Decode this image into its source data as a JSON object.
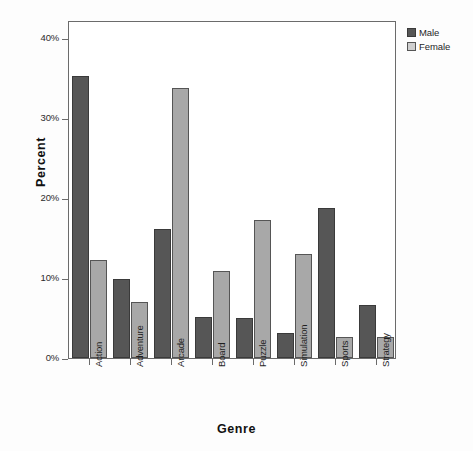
{
  "chart_data": {
    "type": "bar",
    "title": "",
    "xlabel": "Genre",
    "ylabel": "Percent",
    "categories": [
      "Action",
      "Adventure",
      "Arcade",
      "Board",
      "Puzzle",
      "Simulation",
      "Sports",
      "Strategy"
    ],
    "series": [
      {
        "name": "Male",
        "color": "#565656",
        "values": [
          35.3,
          9.9,
          16.1,
          5.1,
          5.0,
          3.1,
          18.7,
          6.6
        ]
      },
      {
        "name": "Female",
        "color": "#a8a8a8",
        "values": [
          12.3,
          7.0,
          33.8,
          10.9,
          17.2,
          13.0,
          2.6,
          2.6
        ]
      }
    ],
    "ylim": [
      0,
      42.25
    ],
    "ytick_values": [
      0,
      10,
      20,
      30,
      40
    ],
    "ytick_labels": [
      "0%",
      "10%",
      "20%",
      "30%",
      "40%"
    ],
    "grid": false,
    "legend_position": "top-right"
  },
  "legend": {
    "items": [
      {
        "label": "Male",
        "swatch": "male"
      },
      {
        "label": "Female",
        "swatch": "female"
      }
    ]
  },
  "axes": {
    "y_title": "Percent",
    "x_title": "Genre"
  }
}
